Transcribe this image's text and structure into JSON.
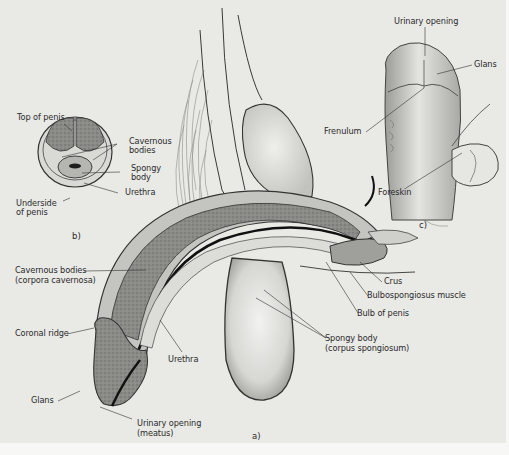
{
  "figure": {
    "type": "anatomical illustration",
    "colors": {
      "background": "#e9e9e6",
      "ink": "#2b2b2b",
      "tissue_dark": "#7c7c7a",
      "tissue_light": "#c9c9c6"
    },
    "panels": {
      "a": {
        "tag": "a)",
        "labels": {
          "cavernous_bodies": "Cavernous bodies",
          "cavernous_bodies_latin": "(corpora cavernosa)",
          "coronal_ridge": "Coronal ridge",
          "urethra": "Urethra",
          "glans": "Glans",
          "urinary_opening": "Urinary opening",
          "urinary_opening_latin": "(meatus)",
          "crus": "Crus",
          "bulbospongiosus": "Bulbospongiosus muscle",
          "bulb": "Bulb of penis",
          "spongy_body": "Spongy body",
          "spongy_body_latin": "(corpus spongiosum)"
        }
      },
      "b": {
        "tag": "b)",
        "labels": {
          "top": "Top of penis",
          "cavernous": "Cavernous",
          "cavernous2": "bodies",
          "spongy": "Spongy",
          "spongy2": "body",
          "urethra": "Urethra",
          "underside": "Underside",
          "underside2": "of penis"
        }
      },
      "c": {
        "tag": "c)",
        "labels": {
          "urinary_opening": "Urinary opening",
          "glans": "Glans",
          "frenulum": "Frenulum",
          "foreskin": "Foreskin"
        }
      }
    }
  }
}
